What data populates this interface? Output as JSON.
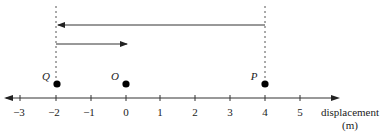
{
  "diagram": {
    "type": "number-line-displacement",
    "axis": {
      "label_line1": "displacement",
      "label_line2": "(m)",
      "ticks": [
        {
          "value": -3,
          "label": "−3",
          "x": 20
        },
        {
          "value": -2,
          "label": "−2",
          "x": 56
        },
        {
          "value": -1,
          "label": "−1",
          "x": 91
        },
        {
          "value": 0,
          "label": "0",
          "x": 126
        },
        {
          "value": 1,
          "label": "1",
          "x": 160
        },
        {
          "value": 2,
          "label": "2",
          "x": 195
        },
        {
          "value": 3,
          "label": "3",
          "x": 230
        },
        {
          "value": 4,
          "label": "4",
          "x": 265
        },
        {
          "value": 5,
          "label": "5",
          "x": 300
        }
      ]
    },
    "points": [
      {
        "name": "Q",
        "label": "Q",
        "position": -2
      },
      {
        "name": "O",
        "label": "O",
        "position": 0
      },
      {
        "name": "P",
        "label": "P",
        "position": 4
      }
    ],
    "arrows": [
      {
        "name": "P-to-Q",
        "from": 4,
        "to": -2,
        "description": "displacement from P to Q"
      },
      {
        "name": "Q-to-O",
        "from": -2,
        "to": 0,
        "description": "displacement from Q to O"
      }
    ],
    "colors": {
      "line": "#333333",
      "dashed": "#555555",
      "dot": "#000000"
    }
  }
}
